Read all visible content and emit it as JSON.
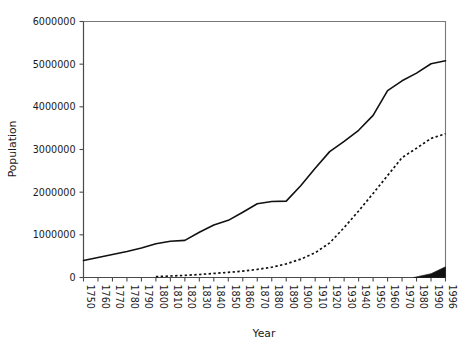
{
  "chart_data": {
    "type": "line",
    "title": "",
    "xlabel": "Year",
    "ylabel": "Population",
    "xlim": [
      1750,
      1996
    ],
    "ylim": [
      0,
      6000000
    ],
    "grid": false,
    "legend_position": "none",
    "y_ticks": [
      0,
      1000000,
      2000000,
      3000000,
      4000000,
      5000000,
      6000000
    ],
    "y_tick_labels": [
      "0",
      "1000000",
      "2000000",
      "3000000",
      "4000000",
      "5000000",
      "6000000"
    ],
    "x_ticks": [
      1750,
      1760,
      1770,
      1780,
      1790,
      1800,
      1810,
      1820,
      1830,
      1840,
      1850,
      1860,
      1870,
      1880,
      1890,
      1900,
      1910,
      1920,
      1930,
      1940,
      1950,
      1960,
      1970,
      1980,
      1990,
      1996
    ],
    "x_tick_labels": [
      "1750",
      "1760",
      "1770",
      "1780",
      "1790",
      "1800",
      "1810",
      "1820",
      "1830",
      "1840",
      "1850",
      "1860",
      "1870",
      "1880",
      "1890",
      "1900",
      "1910",
      "1920",
      "1930",
      "1940",
      "1950",
      "1960",
      "1970",
      "1980",
      "1990",
      "1996"
    ],
    "series": [
      {
        "name": "solid-series",
        "style": "solid",
        "x": [
          1750,
          1760,
          1770,
          1780,
          1790,
          1800,
          1810,
          1820,
          1830,
          1840,
          1850,
          1860,
          1870,
          1880,
          1890,
          1900,
          1910,
          1920,
          1930,
          1940,
          1950,
          1960,
          1970,
          1980,
          1990,
          1996
        ],
        "values": [
          400000,
          470000,
          540000,
          610000,
          690000,
          790000,
          850000,
          870000,
          1060000,
          1230000,
          1340000,
          1530000,
          1730000,
          1780000,
          1790000,
          2150000,
          2560000,
          2950000,
          3190000,
          3450000,
          3800000,
          4380000,
          4610000,
          4790000,
          5010000,
          5080000
        ]
      },
      {
        "name": "dotted-series",
        "style": "dotted",
        "x": [
          1800,
          1810,
          1820,
          1830,
          1840,
          1850,
          1860,
          1870,
          1880,
          1890,
          1900,
          1910,
          1920,
          1930,
          1940,
          1950,
          1960,
          1970,
          1980,
          1990,
          1996
        ],
        "values": [
          20000,
          35000,
          50000,
          70000,
          95000,
          120000,
          150000,
          190000,
          240000,
          320000,
          430000,
          580000,
          810000,
          1170000,
          1560000,
          1970000,
          2390000,
          2810000,
          3030000,
          3260000,
          3370000
        ]
      },
      {
        "name": "wedge-series",
        "style": "filled",
        "x": [
          1978,
          1990,
          1996
        ],
        "values": [
          0,
          90000,
          250000
        ]
      }
    ]
  }
}
